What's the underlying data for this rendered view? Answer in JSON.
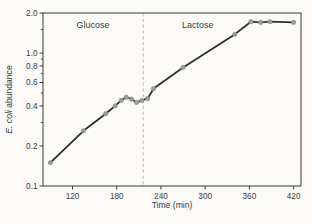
{
  "figure": {
    "background": "#fbfaf7"
  },
  "chart_data": {
    "type": "line",
    "title": "",
    "xlabel": "Time (min)",
    "ylabel_italic_part": "E. coli",
    "ylabel_regular_part": " abundance",
    "xlim": [
      80,
      430
    ],
    "ylim": [
      0.1,
      2.0
    ],
    "y_scale": "log",
    "grid": false,
    "legend_position": "none",
    "x_ticks": [
      {
        "v": 120,
        "label": "120"
      },
      {
        "v": 180,
        "label": "180"
      },
      {
        "v": 240,
        "label": "240"
      },
      {
        "v": 300,
        "label": "300"
      },
      {
        "v": 360,
        "label": "360"
      },
      {
        "v": 420,
        "label": "420"
      }
    ],
    "y_ticks": [
      {
        "v": 2.0,
        "label": "2.0"
      },
      {
        "v": 1.0,
        "label": "1.0"
      },
      {
        "v": 0.8,
        "label": "0.8"
      },
      {
        "v": 0.6,
        "label": "0.6"
      },
      {
        "v": 0.4,
        "label": "0.4"
      },
      {
        "v": 0.2,
        "label": "0.2"
      },
      {
        "v": 0.1,
        "label": "0.1"
      }
    ],
    "y_ticks_minor": [
      1.5,
      0.9,
      0.7,
      0.5,
      0.3
    ],
    "series": [
      {
        "name": "E. coli abundance",
        "x": [
          90,
          135,
          165,
          178,
          186,
          193,
          200,
          207,
          214,
          222,
          230,
          270,
          340,
          362,
          375,
          388,
          420
        ],
        "y": [
          0.15,
          0.26,
          0.35,
          0.4,
          0.44,
          0.465,
          0.45,
          0.425,
          0.44,
          0.455,
          0.54,
          0.78,
          1.38,
          1.72,
          1.7,
          1.72,
          1.7
        ],
        "line_color": "#2e2e2e",
        "marker_color": "#9b9b9b",
        "marker_stroke": "#8a8a8a"
      }
    ],
    "phase_boundary": {
      "time": 216,
      "color": "#bfbfbd",
      "style": "dashed"
    },
    "annotations": [
      {
        "label": "Glucose",
        "t": 148,
        "v": 1.72
      },
      {
        "label": "Lactose",
        "t": 290,
        "v": 1.72
      }
    ],
    "colors": {
      "axis": "#3a3a3a",
      "text": "#3a3a3a",
      "background": "#fbfaf7"
    }
  }
}
